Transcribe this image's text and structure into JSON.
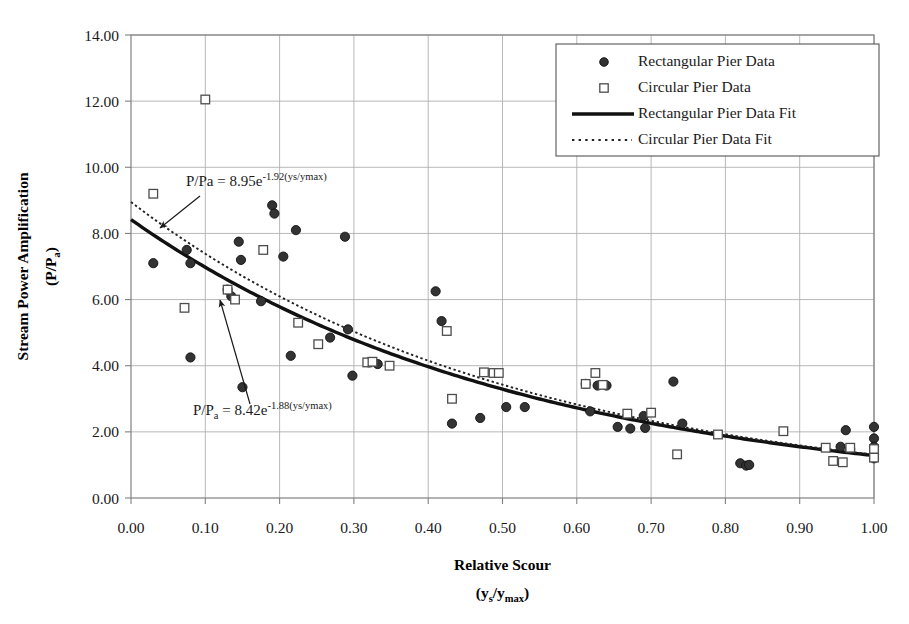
{
  "chart_data": {
    "type": "scatter",
    "title": "",
    "xlabel": "Relative Scour",
    "xlabel_sub": "(ys/ymax)",
    "ylabel": "Stream Power Amplification",
    "ylabel_sub": "(P/Pa)",
    "xlim": [
      0.0,
      1.0
    ],
    "ylim": [
      0.0,
      14.0
    ],
    "xticks": [
      "0.00",
      "0.10",
      "0.20",
      "0.30",
      "0.40",
      "0.50",
      "0.60",
      "0.70",
      "0.80",
      "0.90",
      "1.00"
    ],
    "xtick_values": [
      0.0,
      0.1,
      0.2,
      0.3,
      0.4,
      0.5,
      0.6,
      0.7,
      0.8,
      0.9,
      1.0
    ],
    "yticks": [
      "0.00",
      "2.00",
      "4.00",
      "6.00",
      "8.00",
      "10.00",
      "12.00",
      "14.00"
    ],
    "ytick_values": [
      0,
      2,
      4,
      6,
      8,
      10,
      12,
      14
    ],
    "grid": true,
    "grid_color": "#b0b0b0",
    "legend_position": "top-right",
    "series": [
      {
        "name": "Rectangular Pier Data",
        "marker": "filled-circle",
        "color": "#333333",
        "points": [
          [
            0.03,
            7.1
          ],
          [
            0.075,
            7.5
          ],
          [
            0.08,
            7.1
          ],
          [
            0.08,
            4.25
          ],
          [
            0.13,
            6.3
          ],
          [
            0.135,
            6.1
          ],
          [
            0.145,
            7.75
          ],
          [
            0.148,
            7.2
          ],
          [
            0.15,
            3.35
          ],
          [
            0.175,
            5.95
          ],
          [
            0.19,
            8.85
          ],
          [
            0.193,
            8.6
          ],
          [
            0.205,
            7.3
          ],
          [
            0.215,
            4.3
          ],
          [
            0.222,
            8.1
          ],
          [
            0.268,
            4.85
          ],
          [
            0.288,
            7.9
          ],
          [
            0.292,
            5.1
          ],
          [
            0.298,
            3.7
          ],
          [
            0.32,
            4.1
          ],
          [
            0.332,
            4.05
          ],
          [
            0.41,
            6.25
          ],
          [
            0.418,
            5.35
          ],
          [
            0.432,
            2.25
          ],
          [
            0.47,
            2.42
          ],
          [
            0.505,
            2.75
          ],
          [
            0.53,
            2.75
          ],
          [
            0.612,
            3.45
          ],
          [
            0.618,
            2.62
          ],
          [
            0.628,
            3.4
          ],
          [
            0.64,
            3.4
          ],
          [
            0.655,
            2.15
          ],
          [
            0.672,
            2.1
          ],
          [
            0.69,
            2.48
          ],
          [
            0.692,
            2.12
          ],
          [
            0.73,
            3.52
          ],
          [
            0.742,
            2.25
          ],
          [
            0.82,
            1.05
          ],
          [
            0.828,
            0.98
          ],
          [
            0.832,
            1.0
          ],
          [
            0.955,
            1.55
          ],
          [
            0.962,
            2.05
          ],
          [
            0.968,
            1.48
          ],
          [
            1.0,
            2.15
          ],
          [
            1.0,
            1.8
          ],
          [
            1.0,
            1.55
          ],
          [
            1.0,
            1.32
          ],
          [
            1.0,
            1.2
          ]
        ]
      },
      {
        "name": "Circular Pier Data",
        "marker": "open-square",
        "color": "#4d4d4d",
        "points": [
          [
            0.03,
            9.2
          ],
          [
            0.072,
            5.75
          ],
          [
            0.1,
            12.05
          ],
          [
            0.13,
            6.3
          ],
          [
            0.14,
            6.0
          ],
          [
            0.178,
            7.5
          ],
          [
            0.225,
            5.3
          ],
          [
            0.252,
            4.65
          ],
          [
            0.318,
            4.1
          ],
          [
            0.325,
            4.12
          ],
          [
            0.348,
            4.0
          ],
          [
            0.425,
            5.05
          ],
          [
            0.432,
            3.0
          ],
          [
            0.475,
            3.8
          ],
          [
            0.488,
            3.78
          ],
          [
            0.495,
            3.78
          ],
          [
            0.612,
            3.45
          ],
          [
            0.625,
            3.78
          ],
          [
            0.635,
            3.42
          ],
          [
            0.668,
            2.55
          ],
          [
            0.7,
            2.58
          ],
          [
            0.735,
            1.32
          ],
          [
            0.79,
            1.92
          ],
          [
            0.878,
            2.02
          ],
          [
            0.935,
            1.52
          ],
          [
            0.945,
            1.12
          ],
          [
            0.958,
            1.08
          ],
          [
            0.968,
            1.52
          ],
          [
            1.0,
            1.48
          ],
          [
            1.0,
            1.22
          ]
        ]
      }
    ],
    "fits": [
      {
        "name": "Rectangular Pier Data Fit",
        "style": "solid",
        "coefficient": 8.42,
        "exponent": -1.88,
        "equation_display": "P/Pa = 8.42e-1.88(ys/ymax)",
        "equation_prefix": "P/P",
        "equation_sub": "a",
        "equation_mid": " = 8.42e",
        "equation_sup": "-1.88(ys/ymax)",
        "annotation_x": 193,
        "annotation_y": 415,
        "arrow_from_x": 250,
        "arrow_from_y": 404,
        "arrow_to_x": 220,
        "arrow_to_y": 300
      },
      {
        "name": "Circular Pier Data Fit",
        "style": "dotted",
        "coefficient": 8.95,
        "exponent": -1.92,
        "equation_display": "P/Pa = 8.95e-1.92(ys/ymax)",
        "equation_prefix": "P/Pa",
        "equation_sub": "",
        "equation_mid": " = 8.95e",
        "equation_sup": "-1.92(ys/ymax)",
        "annotation_x": 186,
        "annotation_y": 186,
        "arrow_from_x": 200,
        "arrow_from_y": 196,
        "arrow_to_x": 160,
        "arrow_to_y": 228
      }
    ],
    "legend": [
      {
        "label": "Rectangular Pier Data",
        "marker": "filled-circle"
      },
      {
        "label": "Circular Pier Data",
        "marker": "open-square"
      },
      {
        "label": "Rectangular Pier Data Fit",
        "marker": "solid-line"
      },
      {
        "label": "Circular Pier Data Fit",
        "marker": "dotted-line"
      }
    ]
  }
}
